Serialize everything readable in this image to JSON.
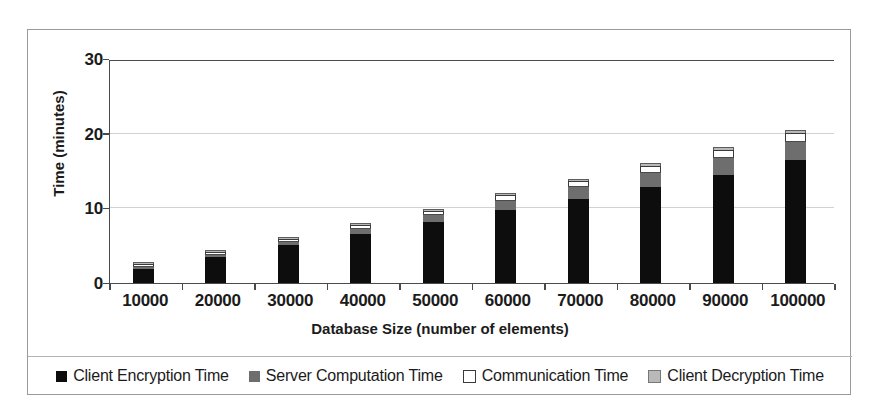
{
  "chart_data": {
    "type": "bar",
    "stacked": true,
    "title": "",
    "xlabel": "Database Size (number of elements)",
    "ylabel": "Time (minutes)",
    "categories": [
      "10000",
      "20000",
      "30000",
      "40000",
      "50000",
      "60000",
      "70000",
      "80000",
      "90000",
      "100000"
    ],
    "ylim": [
      0,
      30
    ],
    "yticks": [
      "0",
      "10",
      "20",
      "30"
    ],
    "ytick_values": [
      0,
      10,
      20,
      30
    ],
    "grid": "horizontal",
    "legend_position": "bottom",
    "series": [
      {
        "name": "Client Encryption Time",
        "color": "#0d0d0d",
        "swatch": "filled-black",
        "values": [
          1.9,
          3.5,
          5.1,
          6.6,
          8.2,
          9.8,
          11.2,
          12.9,
          14.5,
          16.5
        ]
      },
      {
        "name": "Server Computation Time",
        "color": "#6e6e6e",
        "swatch": "filled-dark-gray",
        "values": [
          0.15,
          0.3,
          0.4,
          0.7,
          0.9,
          1.2,
          1.6,
          1.9,
          2.3,
          2.4
        ]
      },
      {
        "name": "Communication Time",
        "color": "#ffffff",
        "swatch": "outlined-white",
        "values": [
          0.1,
          0.15,
          0.2,
          0.3,
          0.4,
          0.6,
          0.7,
          0.8,
          0.9,
          1.0
        ]
      },
      {
        "name": "Client Decryption Time",
        "color": "#b9b9b9",
        "swatch": "filled-light-gray",
        "values": [
          0.05,
          0.1,
          0.1,
          0.15,
          0.2,
          0.25,
          0.3,
          0.35,
          0.4,
          0.4
        ]
      }
    ],
    "totals": [
      2.2,
      4.05,
      5.8,
      7.75,
      9.7,
      11.85,
      13.8,
      15.95,
      18.1,
      20.3
    ]
  }
}
